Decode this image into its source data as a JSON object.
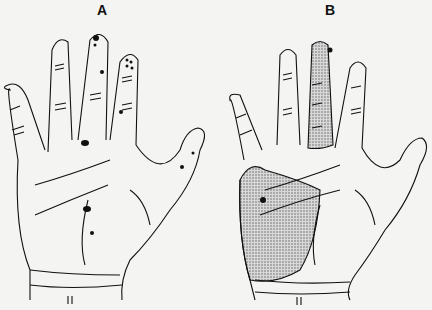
{
  "figure": {
    "panels": [
      {
        "label": "A",
        "description": "Palmar hand with multiple scattered dark spots on fingers and palm"
      },
      {
        "label": "B",
        "description": "Palmar hand with shaded (stippled) region covering middle finger and radial/thenar palm, with dark spots"
      }
    ],
    "colors": {
      "background": "#f4f4f2",
      "ink": "#111111",
      "shading": "#b8b8b8"
    }
  }
}
